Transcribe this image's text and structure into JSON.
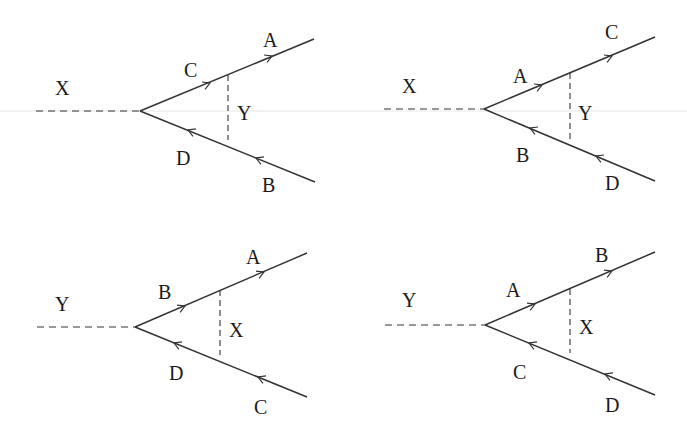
{
  "figure": {
    "line_color": "#333333",
    "background": "#ffffff"
  },
  "diagrams": [
    {
      "id": "top-left",
      "external_boson": "X",
      "internal_boson": "Y",
      "upper_inner": "C",
      "upper_outer": "A",
      "lower_inner": "D",
      "lower_outer": "B",
      "upper_arrow_direction": "outward",
      "lower_arrow_direction": "inward"
    },
    {
      "id": "top-right",
      "external_boson": "X",
      "internal_boson": "Y",
      "upper_inner": "A",
      "upper_outer": "C",
      "lower_inner": "B",
      "lower_outer": "D",
      "upper_arrow_direction": "outward",
      "lower_arrow_direction": "inward"
    },
    {
      "id": "bottom-left",
      "external_boson": "Y",
      "internal_boson": "X",
      "upper_inner": "B",
      "upper_outer": "A",
      "lower_inner": "D",
      "lower_outer": "C",
      "upper_arrow_direction": "outward",
      "lower_arrow_direction": "inward"
    },
    {
      "id": "bottom-right",
      "external_boson": "Y",
      "internal_boson": "X",
      "upper_inner": "A",
      "upper_outer": "B",
      "lower_inner": "C",
      "lower_outer": "D",
      "upper_arrow_direction": "outward",
      "lower_arrow_direction": "inward"
    }
  ]
}
